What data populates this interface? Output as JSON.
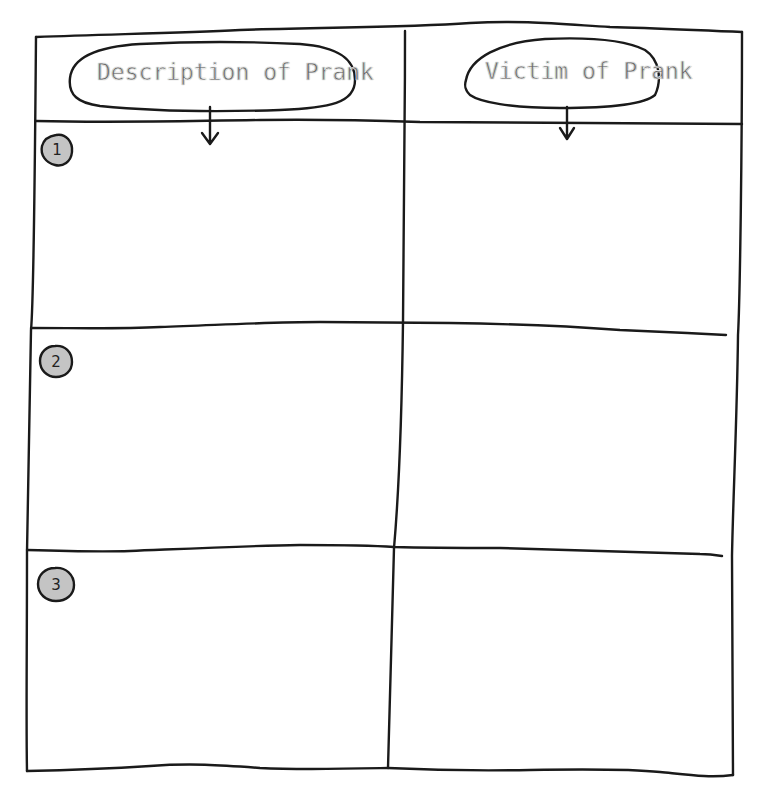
{
  "worksheet": {
    "columns": [
      {
        "header": "Description of Prank"
      },
      {
        "header": "Victim of Prank"
      }
    ],
    "rows": [
      {
        "number": "1",
        "description": "",
        "victim": ""
      },
      {
        "number": "2",
        "description": "",
        "victim": ""
      },
      {
        "number": "3",
        "description": "",
        "victim": ""
      }
    ],
    "colors": {
      "ink": "#1a1a1a",
      "header_text": "#6a6a6a",
      "badge_fill": "#c4c4c4",
      "paper": "#ffffff"
    }
  }
}
